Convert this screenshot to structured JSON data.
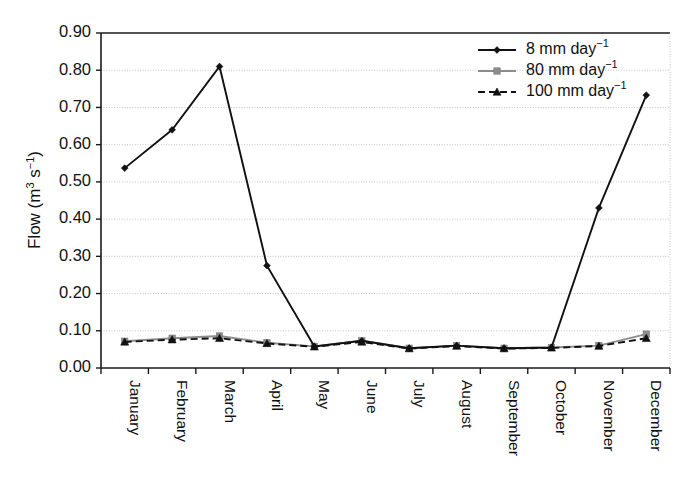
{
  "chart_data": {
    "type": "line",
    "title": "",
    "xlabel": "",
    "ylabel": "Flow (m3 s-1)",
    "ylabel_parts": {
      "prefix": "Flow (m",
      "exp1": "3",
      "mid": " s",
      "exp2": "−1",
      "suffix": ")"
    },
    "categories": [
      "January",
      "February",
      "March",
      "April",
      "May",
      "June",
      "July",
      "August",
      "September",
      "October",
      "November",
      "December"
    ],
    "ylim": [
      0.0,
      0.9
    ],
    "ytick_values": [
      0.0,
      0.1,
      0.2,
      0.3,
      0.4,
      0.5,
      0.6,
      0.7,
      0.8,
      0.9
    ],
    "ytick_labels": [
      "0.00",
      "0.10",
      "0.20",
      "0.30",
      "0.40",
      "0.50",
      "0.60",
      "0.70",
      "0.80",
      "0.90"
    ],
    "grid": true,
    "grid_axis": "y",
    "legend_position": "top-right",
    "series": [
      {
        "name": "8 mm day-1",
        "label_parts": {
          "text": "8 mm day",
          "exp": "−1"
        },
        "color": "#111111",
        "marker": "diamond",
        "dash": "solid",
        "values": [
          0.537,
          0.64,
          0.81,
          0.275,
          0.058,
          0.073,
          0.053,
          0.06,
          0.053,
          0.055,
          0.43,
          0.733
        ]
      },
      {
        "name": "80 mm day-1",
        "label_parts": {
          "text": "80 mm day",
          "exp": "−1"
        },
        "color": "#8c8c8c",
        "marker": "square",
        "dash": "solid",
        "values": [
          0.072,
          0.08,
          0.086,
          0.068,
          0.058,
          0.073,
          0.053,
          0.06,
          0.053,
          0.055,
          0.06,
          0.091
        ]
      },
      {
        "name": "100 mm day-1",
        "label_parts": {
          "text": "100 mm day",
          "exp": "−1"
        },
        "color": "#111111",
        "marker": "triangle",
        "dash": "dashed",
        "values": [
          0.07,
          0.076,
          0.08,
          0.066,
          0.057,
          0.07,
          0.052,
          0.059,
          0.052,
          0.054,
          0.059,
          0.08
        ]
      }
    ]
  },
  "colors": {
    "background": "#ffffff",
    "axis": "#1a1a1a",
    "grid": "#bdbdbd",
    "series_8mm": "#111111",
    "series_80mm": "#8c8c8c",
    "series_100mm": "#111111"
  }
}
